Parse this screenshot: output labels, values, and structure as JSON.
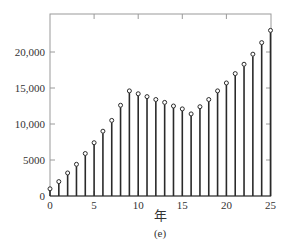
{
  "chart_data": {
    "type": "stem",
    "title": "",
    "xlabel": "年",
    "ylabel": "",
    "caption": "(e)",
    "xlim": [
      0,
      25
    ],
    "ylim": [
      0,
      24000
    ],
    "grid": false,
    "legend": null,
    "x_ticks": [
      0,
      5,
      10,
      15,
      20,
      25
    ],
    "x_tick_labels": [
      "0",
      "5",
      "10",
      "15",
      "20",
      "25"
    ],
    "y_ticks": [
      0,
      5000,
      10000,
      15000,
      20000
    ],
    "y_tick_labels": [
      "0",
      "5000",
      "10,000",
      "15,000",
      "20,000"
    ],
    "x": [
      0,
      1,
      2,
      3,
      4,
      5,
      6,
      7,
      8,
      9,
      10,
      11,
      12,
      13,
      14,
      15,
      16,
      17,
      18,
      19,
      20,
      21,
      22,
      23,
      24,
      25
    ],
    "values": [
      1000,
      2000,
      3200,
      4400,
      5900,
      7400,
      9000,
      10500,
      12600,
      14600,
      14200,
      13800,
      13400,
      13000,
      12500,
      12100,
      11400,
      12400,
      13400,
      14600,
      15700,
      17000,
      18300,
      19700,
      21300,
      23000
    ],
    "colors": {
      "stem": "#2a2a2a",
      "marker_edge": "#2a2a2a",
      "marker_fill": "#ffffff",
      "axis": "#9a9a9a",
      "text": "#333333"
    }
  }
}
